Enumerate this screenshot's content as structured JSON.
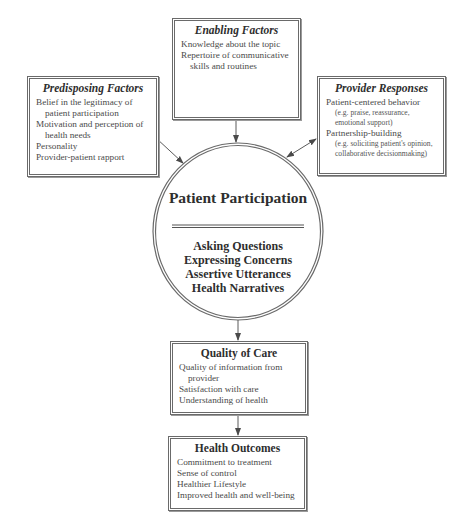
{
  "enabling": {
    "title": "Enabling Factors",
    "items": [
      "Knowledge about the topic",
      "Repertoire of communicative skills and routines"
    ]
  },
  "predisposing": {
    "title": "Predisposing Factors",
    "items": [
      "Belief in the legitimacy of patient participation",
      "Motivation and perception of health needs",
      "Personality",
      "Provider-patient rapport"
    ]
  },
  "provider": {
    "title": "Provider Responses",
    "items": [
      {
        "label": "Patient-centered behavior",
        "note": "(e.g. praise, reassurance, emotional support)"
      },
      {
        "label": "Partnership-building",
        "note": "(e.g. soliciting patient's opinion, collaborative decisionmaking)"
      }
    ]
  },
  "participation": {
    "title": "Patient Participation",
    "items": [
      "Asking Questions",
      "Expressing Concerns",
      "Assertive Utterances",
      "Health Narratives"
    ]
  },
  "quality": {
    "title": "Quality of Care",
    "items": [
      "Quality of information from provider",
      "Satisfaction with care",
      "Understanding of health"
    ]
  },
  "outcomes": {
    "title": "Health Outcomes",
    "items": [
      "Commitment to treatment",
      "Sense of control",
      "Healthier Lifestyle",
      "Improved health and well-being"
    ]
  },
  "colors": {
    "line": "#5a5a5a",
    "text": "#2e2e2e"
  }
}
